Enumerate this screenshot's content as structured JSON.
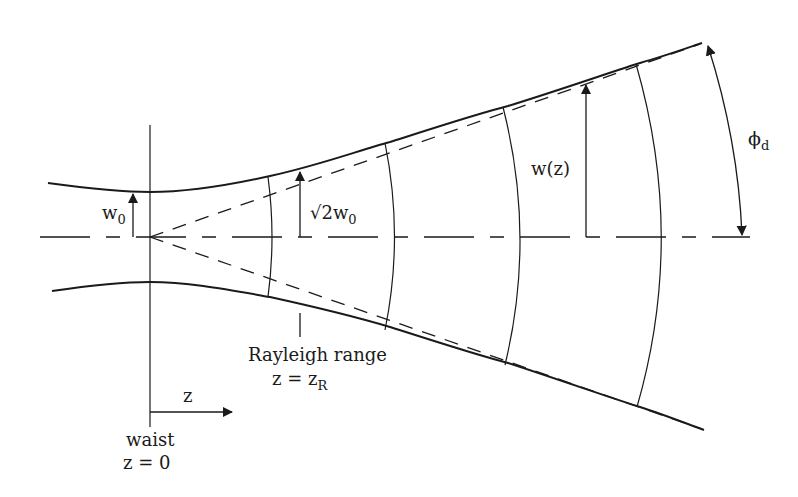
{
  "diagram": {
    "labels": {
      "waist_width": {
        "main": "w",
        "sub": "0"
      },
      "rayleigh_width": {
        "prefix": "√2w",
        "sub": "0"
      },
      "beam_width": "w(z)",
      "divergence_angle": {
        "main": "ϕ",
        "sub": "d"
      },
      "rayleigh_range": "Rayleigh range",
      "rayleigh_eq": {
        "main": "z = z",
        "sub": "R"
      },
      "z_axis": "z",
      "waist": "waist",
      "waist_eq": "z = 0"
    },
    "colors": {
      "stroke": "#1a1a1a",
      "background": "#ffffff"
    }
  }
}
